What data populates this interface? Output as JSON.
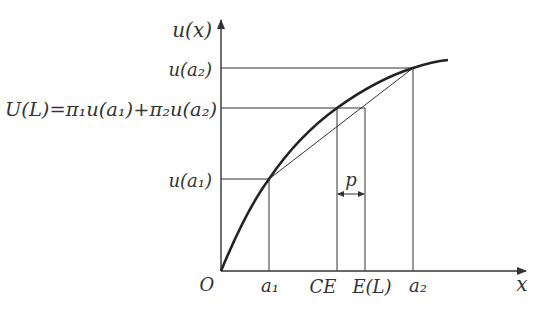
{
  "diagram": {
    "type": "expected-utility-concave-curve",
    "axes": {
      "y_label": "u(x)",
      "x_label": "x",
      "origin_label": "O"
    },
    "y_labels": {
      "u_a2": "u(a₂)",
      "U_L": "U(L)=π₁u(a₁)+π₂u(a₂)",
      "u_a1": "u(a₁)"
    },
    "x_labels": {
      "a1": "a₁",
      "CE": "CE",
      "EL": "E(L)",
      "a2": "a₂"
    },
    "risk_premium_label": "p",
    "colors": {
      "line": "#333333",
      "background": "#ffffff"
    }
  }
}
